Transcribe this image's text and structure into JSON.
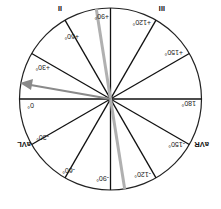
{
  "diagram": {
    "orientation": "rotated 180 degrees",
    "angle_labels": [
      {
        "deg": 0,
        "text": "0°"
      },
      {
        "deg": 30,
        "text": "+30°"
      },
      {
        "deg": 60,
        "text": "+60°"
      },
      {
        "deg": 90,
        "text": "+90°"
      },
      {
        "deg": 120,
        "text": "+120°"
      },
      {
        "deg": 150,
        "text": "+150°"
      },
      {
        "deg": 180,
        "text": "180°"
      },
      {
        "deg": -150,
        "text": "-150°"
      },
      {
        "deg": -120,
        "text": "-120°"
      },
      {
        "deg": -90,
        "text": "-90°"
      },
      {
        "deg": -60,
        "text": "-60°"
      },
      {
        "deg": -30,
        "text": "-30°"
      }
    ],
    "lead_labels": {
      "aVF": "aVF",
      "II": "II",
      "III": "III",
      "aVL": "aVL",
      "aVR": "aVR"
    },
    "axis_arrow": {
      "angle_deg": 10,
      "color": "#8a8a8a"
    },
    "highlight_band": {
      "angle_deg": 81,
      "color": "#b0b0b0"
    },
    "colors": {
      "lines": "#111111",
      "circle": "#222222",
      "background": "#ffffff"
    }
  }
}
